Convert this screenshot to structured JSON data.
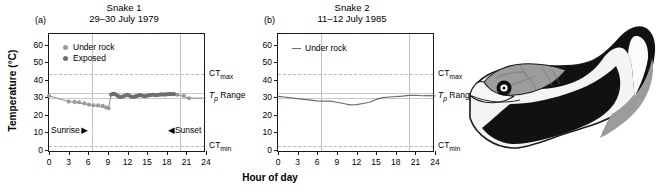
{
  "figure": {
    "y_axis_title": "Temperature (°C)",
    "x_axis_title": "Hour of day",
    "y_ticks": [
      0,
      10,
      20,
      30,
      40,
      50,
      60
    ],
    "x_ticks": [
      0,
      3,
      6,
      9,
      12,
      15,
      18,
      21,
      24
    ],
    "ylim": [
      -2,
      66
    ],
    "xlim": [
      0,
      24
    ],
    "reference_lines": {
      "ct_max_label": "CT",
      "ct_max_sub": "max",
      "ct_max_value": 43,
      "ct_min_label": "CT",
      "ct_min_sub": "min",
      "ct_min_value": 2,
      "tp_range_label": "T",
      "tp_range_sub": "p",
      "tp_range_suffix": " Range",
      "tp_range_low": 29.2,
      "tp_range_high": 32.2
    },
    "sunrise_label": "Sunrise",
    "sunset_label": "Sunset",
    "sunrise_hour": 6.5,
    "sunset_hour": 20.0,
    "colors": {
      "under_rock": "#9a9a9a",
      "exposed": "#6e6e6e",
      "line": "#6b6b6b",
      "axis": "#1a1a1a",
      "dashed": "#b9b9b9",
      "tp_band": "#c9c9c9",
      "snake_dark": "#111111",
      "snake_gray": "#9c9c9c",
      "snake_light": "#f2f2f2"
    }
  },
  "chart_data": [
    {
      "type": "scatter",
      "panel": "a",
      "panel_label": "(a)",
      "title": "Snake 1",
      "subtitle": "29–30 July 1979",
      "xlabel": "Hour of day",
      "ylabel": "Temperature (°C)",
      "xlim": [
        0,
        24
      ],
      "ylim": [
        -2,
        66
      ],
      "grid": false,
      "legend_position": "top-left",
      "legend": [
        "Under rock",
        "Exposed"
      ],
      "series": [
        {
          "name": "Under rock",
          "marker": "circle",
          "color": "#9a9a9a",
          "x": [
            0.0,
            3.0,
            3.9,
            4.6,
            5.4,
            6.1,
            6.8,
            7.5,
            8.2,
            8.7,
            9.1,
            19.6,
            20.6,
            21.4
          ],
          "y": [
            30.7,
            27.4,
            27.2,
            27.0,
            26.4,
            25.6,
            25.3,
            25.2,
            24.9,
            24.1,
            23.6,
            31.3,
            30.7,
            29.3
          ]
        },
        {
          "name": "Exposed",
          "marker": "circle",
          "color": "#6e6e6e",
          "x": [
            9.5,
            9.8,
            10.1,
            10.4,
            10.7,
            11.0,
            11.3,
            11.6,
            11.9,
            12.2,
            12.5,
            12.8,
            13.1,
            13.4,
            13.7,
            14.0,
            14.3,
            14.6,
            14.9,
            15.2,
            15.5,
            15.8,
            16.1,
            16.4,
            16.7,
            17.0,
            17.3,
            17.6,
            17.9,
            18.2,
            18.5,
            18.8,
            19.1
          ],
          "y": [
            31.4,
            31.8,
            31.6,
            30.9,
            30.2,
            30.0,
            30.3,
            30.7,
            31.3,
            31.0,
            30.3,
            30.0,
            30.2,
            30.5,
            30.9,
            31.1,
            30.7,
            30.4,
            30.6,
            30.9,
            31.1,
            31.3,
            31.2,
            31.0,
            31.2,
            31.4,
            31.5,
            31.4,
            31.5,
            31.6,
            31.6,
            31.7,
            31.6
          ]
        }
      ],
      "connecting_line": {
        "x": [
          0.0,
          3.0,
          6.0,
          9.1,
          9.5,
          12.0,
          15.0,
          18.0,
          19.6,
          21.4,
          24.0
        ],
        "y": [
          30.7,
          27.4,
          25.7,
          23.6,
          31.4,
          30.5,
          30.9,
          31.4,
          31.3,
          29.3,
          29.4
        ]
      }
    },
    {
      "type": "line",
      "panel": "b",
      "panel_label": "(b)",
      "title": "Snake 2",
      "subtitle": "11–12 July 1985",
      "xlabel": "Hour of day",
      "ylabel": "Temperature (°C)",
      "xlim": [
        0,
        24
      ],
      "ylim": [
        -2,
        66
      ],
      "grid": false,
      "legend_position": "top-left",
      "legend": [
        "Under rock"
      ],
      "series": [
        {
          "name": "Under rock",
          "color": "#6b6b6b",
          "x": [
            0,
            1,
            2,
            3,
            4,
            5,
            6,
            7,
            8,
            9,
            10,
            11,
            12,
            13,
            14,
            15,
            16,
            17,
            18,
            19,
            20,
            21,
            22,
            23,
            24
          ],
          "y": [
            30.4,
            30.0,
            29.5,
            29.1,
            28.6,
            28.2,
            27.8,
            27.6,
            27.6,
            27.0,
            26.3,
            25.5,
            25.6,
            26.3,
            27.0,
            28.6,
            29.6,
            30.0,
            30.2,
            30.5,
            30.9,
            31.0,
            30.7,
            30.8,
            30.6
          ]
        }
      ]
    }
  ],
  "illustration": {
    "name": "snake-illustration",
    "description": "Striped snake with banded black, white and gray pattern, head at lower left"
  }
}
